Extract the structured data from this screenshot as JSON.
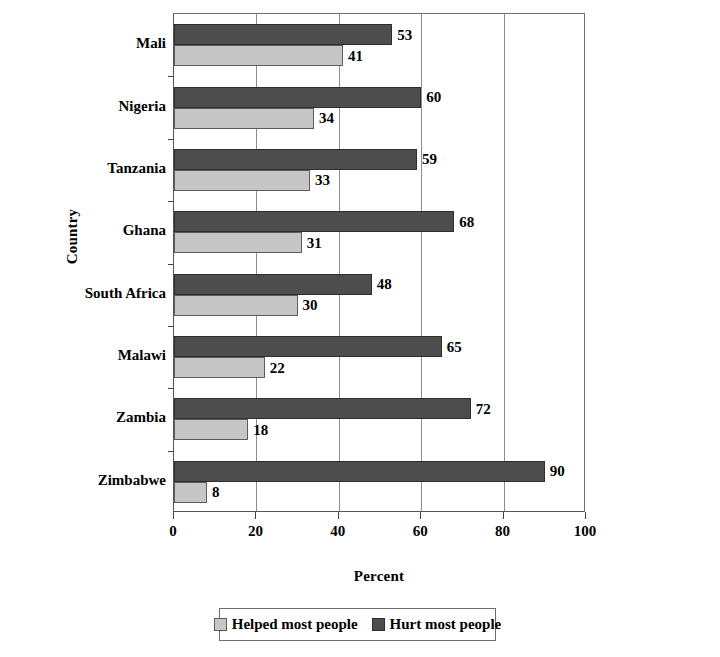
{
  "chart_data": {
    "type": "bar",
    "orientation": "horizontal",
    "title": "",
    "xlabel": "Percent",
    "ylabel": "Country",
    "xlim": [
      0,
      100
    ],
    "xticks": [
      0,
      20,
      40,
      60,
      80,
      100
    ],
    "xtick_labels": [
      "0",
      "20",
      "40",
      "60",
      "80",
      "100"
    ],
    "grid": "vertical",
    "legend_position": "bottom",
    "categories": [
      "Mali",
      "Nigeria",
      "Tanzania",
      "Ghana",
      "South Africa",
      "Malawi",
      "Zambia",
      "Zimbabwe"
    ],
    "series": [
      {
        "name": "Helped most people",
        "color": "#c6c6c6",
        "values": [
          41,
          34,
          33,
          31,
          30,
          22,
          18,
          8
        ]
      },
      {
        "name": "Hurt most people",
        "color": "#4d4d4d",
        "values": [
          53,
          60,
          59,
          68,
          48,
          65,
          72,
          90
        ]
      }
    ]
  },
  "axes": {
    "y_title": "Country",
    "x_title": "Percent"
  },
  "legend": {
    "entries": [
      {
        "label": "Helped most people",
        "swatch": "helped"
      },
      {
        "label": "Hurt most people",
        "swatch": "hurt"
      }
    ]
  }
}
